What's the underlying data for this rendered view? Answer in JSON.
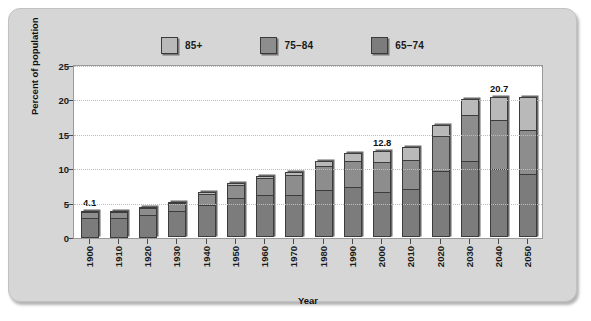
{
  "chart_data": {
    "type": "bar",
    "stacked": true,
    "title": "",
    "xlabel": "Year",
    "ylabel": "Percent of population",
    "ylim": [
      0,
      25
    ],
    "yticks": [
      0,
      5,
      10,
      15,
      20,
      25
    ],
    "grid": true,
    "legend_position": "top-center",
    "categories": [
      "1900",
      "1910",
      "1920",
      "1930",
      "1940",
      "1950",
      "1960",
      "1970",
      "1980",
      "1990",
      "2000",
      "2010",
      "2020",
      "2030",
      "2040",
      "2050"
    ],
    "series": [
      {
        "name": "65–74",
        "color": "#7c7c7c",
        "values": [
          2.9,
          2.9,
          3.3,
          3.8,
          4.7,
          5.6,
          6.1,
          6.1,
          6.9,
          7.2,
          6.6,
          7.0,
          9.6,
          11.1,
          9.9,
          9.2
        ]
      },
      {
        "name": "75–84",
        "color": "#8d8d8d",
        "values": [
          1.0,
          0.9,
          1.1,
          1.3,
          1.7,
          2.1,
          2.6,
          3.0,
          3.5,
          4.0,
          4.5,
          4.4,
          5.2,
          6.8,
          7.3,
          6.5
        ]
      },
      {
        "name": "85+",
        "color": "#b9b9b9",
        "values": [
          0.2,
          0.2,
          0.2,
          0.3,
          0.4,
          0.4,
          0.5,
          0.7,
          0.9,
          1.3,
          1.7,
          2.0,
          1.7,
          2.4,
          3.5,
          5.0
        ]
      }
    ],
    "totals": [
      4.1,
      4.0,
      4.6,
      5.4,
      6.8,
      8.1,
      9.2,
      9.8,
      11.3,
      12.5,
      12.8,
      13.4,
      16.5,
      20.3,
      20.7,
      20.7
    ],
    "annotations": [
      {
        "category": "1900",
        "value": "4.1"
      },
      {
        "category": "2000",
        "value": "12.8"
      },
      {
        "category": "2040",
        "value": "20.7"
      }
    ]
  },
  "legend": {
    "items": [
      {
        "label": "85+",
        "color": "#b9b9b9"
      },
      {
        "label": "75–84",
        "color": "#8d8d8d"
      },
      {
        "label": "65–74",
        "color": "#7c7c7c"
      }
    ]
  }
}
